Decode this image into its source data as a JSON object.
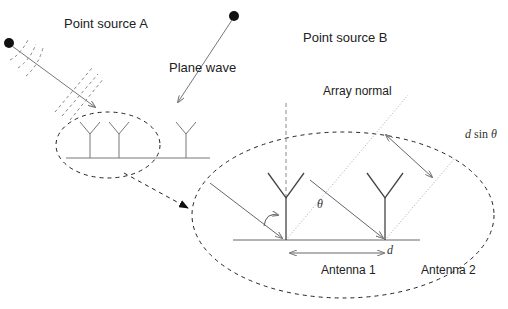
{
  "labels": {
    "point_source_a": "Point source A",
    "point_source_b": "Point source B",
    "plane_wave": "Plane wave",
    "array_normal": "Array normal",
    "d_sin_theta_d": "d",
    "d_sin_theta_sin": " sin ",
    "d_sin_theta_theta": "θ",
    "theta": "θ",
    "d": "d",
    "antenna_1": "Antenna 1",
    "antenna_2": "Antenna 2"
  }
}
